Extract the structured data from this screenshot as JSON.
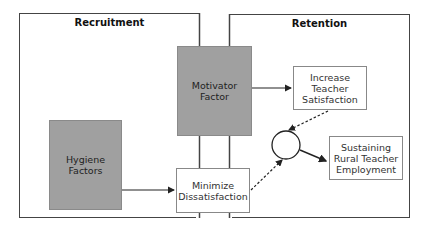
{
  "diagram": {
    "frames": {
      "recruitment": {
        "title": "Recruitment"
      },
      "retention": {
        "title": "Retention"
      }
    },
    "nodes": {
      "motivator": {
        "label": "Motivator\nFactor",
        "fill": "#a0a0a0"
      },
      "hygiene": {
        "label": "Hygiene\nFactors",
        "fill": "#a0a0a0"
      },
      "minimize": {
        "label": "Minimize\nDissatisfaction",
        "fill": "#ffffff"
      },
      "increase": {
        "label": "Increase\nTeacher\nSatisfaction",
        "fill": "#ffffff"
      },
      "sustaining": {
        "label": "Sustaining\nRural Teacher\nEmployment",
        "fill": "#ffffff"
      },
      "junction": {
        "shape": "circle"
      }
    },
    "edges": [
      {
        "from": "motivator",
        "to": "increase",
        "style": "solid"
      },
      {
        "from": "hygiene",
        "to": "minimize",
        "style": "solid"
      },
      {
        "from": "increase",
        "to": "junction",
        "style": "dashed"
      },
      {
        "from": "minimize",
        "to": "junction",
        "style": "dashed"
      },
      {
        "from": "junction",
        "to": "sustaining",
        "style": "solid"
      }
    ]
  }
}
